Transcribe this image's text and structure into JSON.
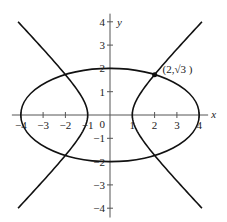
{
  "chart_data": {
    "type": "line",
    "title": "",
    "xlabel": "x",
    "ylabel": "y",
    "xlim": [
      -4,
      4
    ],
    "ylim": [
      -4,
      4
    ],
    "grid": false,
    "x_ticks": [
      -4,
      -3,
      -2,
      -1,
      1,
      2,
      3,
      4
    ],
    "y_ticks": [
      -4,
      -3,
      -2,
      -1,
      1,
      2,
      3,
      4
    ],
    "x_tick_labels": [
      "−4",
      "−3",
      "−2",
      "−1",
      "1",
      "2",
      "3",
      "4"
    ],
    "y_tick_labels": [
      "−4",
      "−3",
      "−2",
      "−1",
      "1",
      "2",
      "3",
      "4"
    ],
    "origin_label": "0",
    "series": [
      {
        "name": "ellipse",
        "equation": "x^2/16 + y^2/4 = 1",
        "semi_axis_x": 4,
        "semi_axis_y": 2
      },
      {
        "name": "hyperbola",
        "equation": "x^2 - y^2 = 1",
        "vertices": [
          [
            -1,
            0
          ],
          [
            1,
            0
          ]
        ],
        "y_range": [
          -4,
          4
        ]
      }
    ],
    "annotations": [
      {
        "type": "point",
        "x": 2,
        "y": 1.732,
        "label": "(2,√3 )"
      }
    ]
  },
  "labels": {
    "x_axis": "x",
    "y_axis": "y",
    "origin": "0",
    "point": "(2,√3 )",
    "x_ticks": [
      "−4",
      "−3",
      "−2",
      "−1",
      "1",
      "2",
      "3",
      "4"
    ],
    "y_ticks_pos": [
      "1",
      "2",
      "3",
      "4"
    ],
    "y_ticks_neg": [
      "−1",
      "−2",
      "−3",
      "−4"
    ]
  }
}
